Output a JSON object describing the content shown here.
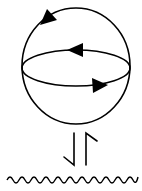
{
  "diagram": {
    "stroke_color": "#000000",
    "background": "#ffffff",
    "sphere": {
      "cx": 76,
      "cy": 66,
      "rx": 54,
      "ry": 58
    },
    "equator": {
      "cx": 76,
      "cy": 68,
      "rx": 54,
      "ry": 18
    },
    "arrows": [
      {
        "name": "top-arc-arrow",
        "direction": "left"
      },
      {
        "name": "equator-back-arrow",
        "direction": "left"
      },
      {
        "name": "equator-front-arrow",
        "direction": "right"
      }
    ],
    "equilibrium_symbol": "⇃↾",
    "interface": {
      "type": "wavy-line",
      "y": 180,
      "x_start": 7,
      "x_end": 138
    }
  }
}
